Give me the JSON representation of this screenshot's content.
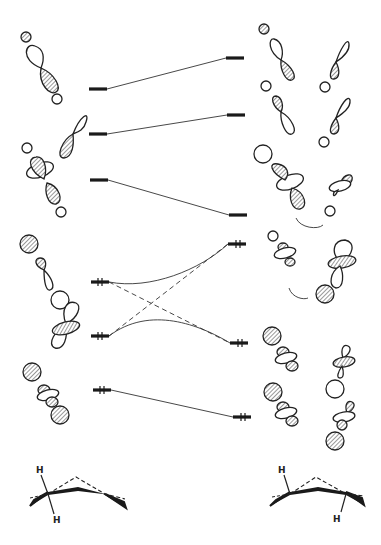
{
  "diagram": {
    "type": "orbital correlation diagram",
    "left_levels": [
      {
        "id": "L1",
        "y": 89,
        "electrons": 0
      },
      {
        "id": "L2",
        "y": 134,
        "electrons": 0
      },
      {
        "id": "L3",
        "y": 180,
        "electrons": 0
      },
      {
        "id": "L4",
        "y": 282,
        "electrons": 2
      },
      {
        "id": "L5",
        "y": 336,
        "electrons": 2
      },
      {
        "id": "L6",
        "y": 390,
        "electrons": 2
      }
    ],
    "right_levels": [
      {
        "id": "R1",
        "y": 58,
        "electrons": 0
      },
      {
        "id": "R2",
        "y": 115,
        "electrons": 0
      },
      {
        "id": "R3",
        "y": 215,
        "electrons": 0
      },
      {
        "id": "R4",
        "y": 244,
        "electrons": 2
      },
      {
        "id": "R5",
        "y": 343,
        "electrons": 2
      },
      {
        "id": "R6",
        "y": 417,
        "electrons": 2
      }
    ],
    "correlations": [
      {
        "from": "L1",
        "to": "R1",
        "style": "solid"
      },
      {
        "from": "L2",
        "to": "R2",
        "style": "solid"
      },
      {
        "from": "L3",
        "to": "R3",
        "style": "solid"
      },
      {
        "from": "L4",
        "to": "R4",
        "style": "solid-curve"
      },
      {
        "from": "L5",
        "to": "R5",
        "style": "solid-curve"
      },
      {
        "from": "L4",
        "to": "R5",
        "style": "dashed"
      },
      {
        "from": "L5",
        "to": "R4",
        "style": "dashed"
      },
      {
        "from": "L6",
        "to": "R6",
        "style": "solid"
      }
    ],
    "structures": {
      "left": {
        "label_top": "H",
        "label_bottom": "H"
      },
      "right": {
        "label_top": "H",
        "label_bottom": "H"
      }
    },
    "colors": {
      "ink": "#1a1a1a",
      "background": "#ffffff"
    }
  }
}
